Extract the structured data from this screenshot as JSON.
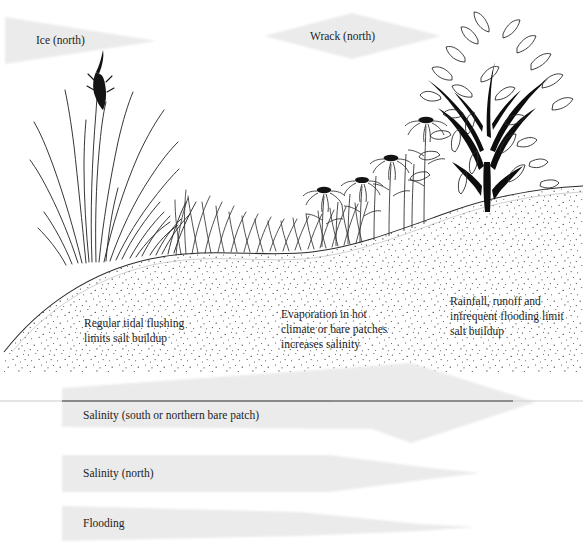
{
  "figure": {
    "type": "salt-marsh-zonation-diagram",
    "background": "#ffffff",
    "wedge_fill": "#ebebeb",
    "ink": "#1d1d1d",
    "water_line_color": "#6e6e6e"
  },
  "top_wedges": [
    {
      "id": "ice",
      "label": "Ice (north)",
      "shape": "triangle-right-taper"
    },
    {
      "id": "wrack",
      "label": "Wrack (north)",
      "shape": "diamond"
    }
  ],
  "scene_notes": [
    {
      "id": "tidal-flushing",
      "lines": [
        "Regular tidal flushing",
        "limits salt buildup"
      ]
    },
    {
      "id": "evaporation",
      "lines": [
        "Evaporation in hot",
        "climate or bare patches",
        "increases salinity"
      ]
    },
    {
      "id": "rainfall-runoff",
      "lines": [
        "Rainfall, runoff and",
        "infrequent flooding limit",
        "salt buildup"
      ]
    }
  ],
  "gradient_bands": [
    {
      "id": "salinity-south",
      "label": "Salinity (south or northern bare patch)",
      "shape": "band-with-diamond-bulge"
    },
    {
      "id": "salinity-north",
      "label": "Salinity (north)",
      "shape": "wedge-right-taper"
    },
    {
      "id": "flooding",
      "label": "Flooding",
      "shape": "wedge-right-taper"
    }
  ],
  "vegetation": {
    "left_zone": "tall-grass-with-dark-seedhead",
    "middle_zone": "short-grass-dip",
    "right_zone": "daisy-flowers-and-black-trunked-tree"
  }
}
